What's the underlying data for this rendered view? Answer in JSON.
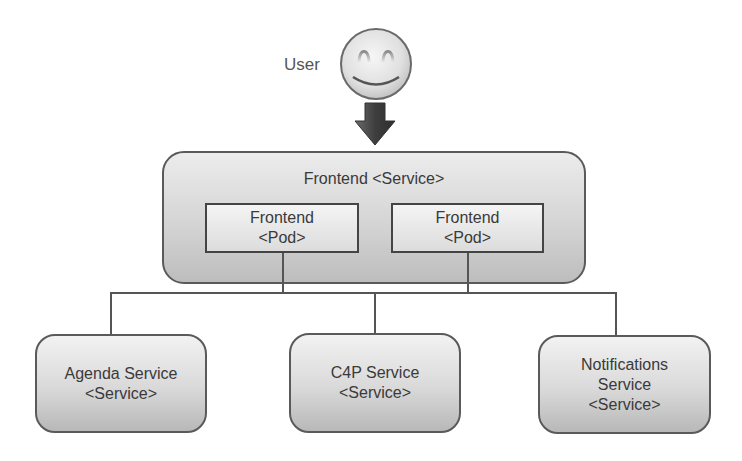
{
  "user": {
    "label": "User",
    "icon": "smiley-face-icon",
    "arrow_icon": "arrow-down-icon"
  },
  "frontend_service": {
    "title": "Frontend <Service>",
    "pods": [
      {
        "name": "Frontend",
        "type": "<Pod>"
      },
      {
        "name": "Frontend",
        "type": "<Pod>"
      }
    ]
  },
  "backend_services": [
    {
      "lines": [
        "Agenda Service",
        "<Service>"
      ]
    },
    {
      "lines": [
        "C4P Service",
        "<Service>"
      ]
    },
    {
      "lines": [
        "Notifications",
        "Service",
        "<Service>"
      ]
    }
  ],
  "colors": {
    "border": "#5a5a5a",
    "box_gradient_top": "#f2f2f2",
    "box_gradient_bottom": "#b8b8b8",
    "arrow": "#4a4a4a",
    "text": "#3a3a3a"
  }
}
